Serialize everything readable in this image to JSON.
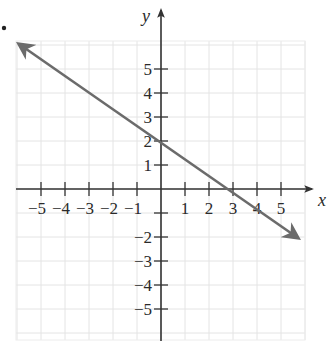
{
  "chart_data": {
    "type": "line",
    "title": "",
    "xlabel": "x",
    "ylabel": "y",
    "xlim": [
      -6,
      6
    ],
    "ylim": [
      -6,
      6
    ],
    "grid": true,
    "x_ticks": [
      -5,
      -4,
      -3,
      -2,
      -1,
      1,
      2,
      3,
      4,
      5
    ],
    "y_ticks": [
      -5,
      -4,
      -3,
      -2,
      5,
      4,
      3,
      2,
      1
    ],
    "x_tick_labels": [
      "−5",
      "−4",
      "−3",
      "−2",
      "−1",
      "1",
      "2",
      "3",
      "4",
      "5"
    ],
    "y_tick_labels_pos": [
      "5",
      "4",
      "3",
      "2",
      "1"
    ],
    "y_tick_labels_neg": [
      "−2",
      "−3",
      "−4",
      "−5"
    ],
    "series": [
      {
        "name": "line",
        "equation": "y = -2/3 x + 2",
        "points": [
          [
            -6,
            6
          ],
          [
            0,
            2
          ],
          [
            3,
            0
          ],
          [
            6,
            -2
          ]
        ],
        "arrows": "both",
        "color": "#6b6b6b"
      }
    ],
    "intercepts": {
      "y_intercept": [
        0,
        2
      ],
      "x_intercept": [
        3,
        0
      ]
    }
  },
  "labels": {
    "x_axis": "x",
    "y_axis": "y",
    "bullet": "•"
  },
  "colors": {
    "axis": "#333333",
    "grid": "#e4e4e4",
    "line": "#6b6b6b",
    "text": "#2a2a2a"
  }
}
